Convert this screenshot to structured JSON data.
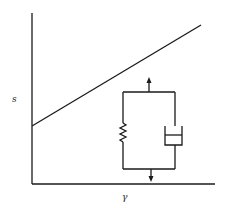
{
  "diagram": {
    "kind": "stress-strain plot with viscoelastic model inset",
    "y_axis_label": "s",
    "x_axis_label": "γ",
    "curve": {
      "type": "linear",
      "description": "straight line starting at a positive intercept on the s-axis, increasing with γ"
    },
    "inset": {
      "model": "Kelvin-Voigt (spring and dashpot in parallel)",
      "elements": [
        "spring",
        "dashpot"
      ],
      "arrows": [
        "up",
        "down"
      ]
    }
  },
  "colors": {
    "line": "#1a1a1a",
    "background": "#ffffff"
  }
}
